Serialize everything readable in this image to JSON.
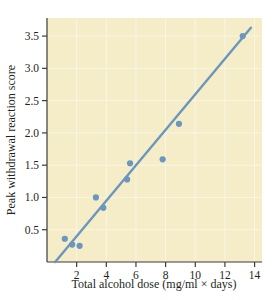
{
  "figure": {
    "background_color": "#ffffff",
    "plot_background_color": "#f5edc8",
    "accent_color": "#6b96bd",
    "axis_color": "#3b3b3b",
    "caption_fragment": ""
  },
  "chart_data": {
    "type": "scatter",
    "title": "",
    "xlabel": "Total alcohol dose (mg/ml × days)",
    "ylabel": "Peak withdrawal reaction score",
    "xlim": [
      0,
      14.5
    ],
    "ylim": [
      0,
      3.78
    ],
    "xticks": [
      2,
      4,
      6,
      8,
      10,
      12,
      14
    ],
    "yticks": [
      0.5,
      1.0,
      1.5,
      2.0,
      2.5,
      3.0,
      3.5
    ],
    "xtick_labels": [
      "2",
      "4",
      "6",
      "8",
      "10",
      "12",
      "14"
    ],
    "ytick_labels": [
      "0.5",
      "1.0",
      "1.5",
      "2.0",
      "2.5",
      "3.0",
      "3.5"
    ],
    "grid": true,
    "legend": "none",
    "marker_color": "#6b96bd",
    "line_color": "#6b96bd",
    "points": [
      {
        "x": 1.2,
        "y": 0.36
      },
      {
        "x": 1.7,
        "y": 0.27
      },
      {
        "x": 2.2,
        "y": 0.25
      },
      {
        "x": 3.3,
        "y": 1.0
      },
      {
        "x": 3.8,
        "y": 0.84
      },
      {
        "x": 5.4,
        "y": 1.28
      },
      {
        "x": 5.6,
        "y": 1.53
      },
      {
        "x": 7.8,
        "y": 1.59
      },
      {
        "x": 8.9,
        "y": 2.14
      },
      {
        "x": 13.2,
        "y": 3.5
      }
    ],
    "series": [
      {
        "name": "Peak withdrawal reaction score",
        "x": [
          1.2,
          1.7,
          2.2,
          3.3,
          3.8,
          5.4,
          5.6,
          7.8,
          8.9,
          13.2
        ],
        "values": [
          0.36,
          0.27,
          0.25,
          1.0,
          0.84,
          1.28,
          1.53,
          1.59,
          2.14,
          3.5
        ]
      }
    ],
    "trendline": {
      "type": "linear-fit",
      "x_start": 0.55,
      "y_start": 0.0,
      "x_end": 13.75,
      "y_end": 3.63
    }
  }
}
